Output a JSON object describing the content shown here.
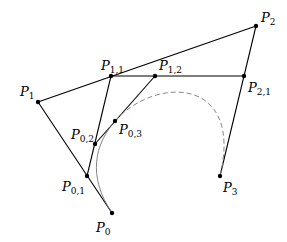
{
  "diagram": {
    "points": [
      {
        "id": "P0",
        "base": "P",
        "sub": "0",
        "x": 112,
        "y": 213,
        "lx": 96,
        "ly": 232
      },
      {
        "id": "P1",
        "base": "P",
        "sub": "1",
        "x": 38,
        "y": 102,
        "lx": 20,
        "ly": 96
      },
      {
        "id": "P2",
        "base": "P",
        "sub": "2",
        "x": 256,
        "y": 26,
        "lx": 261,
        "ly": 22
      },
      {
        "id": "P3",
        "base": "P",
        "sub": "3",
        "x": 220,
        "y": 176,
        "lx": 223,
        "ly": 192
      },
      {
        "id": "P01",
        "base": "P",
        "sub": "0,1",
        "x": 87,
        "y": 176,
        "lx": 62,
        "ly": 191
      },
      {
        "id": "P02",
        "base": "P",
        "sub": "0,2",
        "x": 95,
        "y": 144,
        "lx": 71,
        "ly": 139
      },
      {
        "id": "P03",
        "base": "P",
        "sub": "0,3",
        "x": 115,
        "y": 121,
        "lx": 119,
        "ly": 134
      },
      {
        "id": "P11",
        "base": "P",
        "sub": "1,1",
        "x": 111,
        "y": 76,
        "lx": 101,
        "ly": 70
      },
      {
        "id": "P12",
        "base": "P",
        "sub": "1,2",
        "x": 155,
        "y": 76,
        "lx": 159,
        "ly": 70
      },
      {
        "id": "P21",
        "base": "P",
        "sub": "2,1",
        "x": 244,
        "y": 76,
        "lx": 248,
        "ly": 92
      }
    ],
    "segments": [
      [
        "P0",
        "P1"
      ],
      [
        "P1",
        "P2"
      ],
      [
        "P2",
        "P3"
      ],
      [
        "P11",
        "P21"
      ],
      [
        "P01",
        "P11"
      ],
      [
        "P11",
        "P12"
      ],
      [
        "P02",
        "P12"
      ]
    ],
    "colors": {
      "line": "#000000",
      "curve": "#777777",
      "dashed": "#888888"
    }
  }
}
